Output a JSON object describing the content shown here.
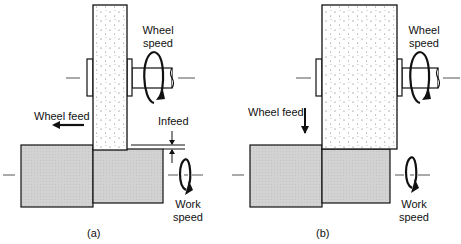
{
  "panels": [
    {
      "id": "a",
      "caption": "(a)",
      "wheel_speed_label": [
        "Wheel",
        "speed"
      ],
      "wheel_feed_label": "Wheel feed",
      "wheel_feed_direction": "left",
      "infeed_label": "Infeed",
      "work_speed_label": [
        "Work",
        "speed"
      ]
    },
    {
      "id": "b",
      "caption": "(b)",
      "wheel_speed_label": [
        "Wheel",
        "speed"
      ],
      "wheel_feed_label": "Wheel feed",
      "wheel_feed_direction": "down",
      "work_speed_label": [
        "Work",
        "speed"
      ]
    }
  ],
  "colors": {
    "line": "#111111",
    "workpiece_fill": "#d4d4d4",
    "wheel_fill": "#ffffff"
  }
}
